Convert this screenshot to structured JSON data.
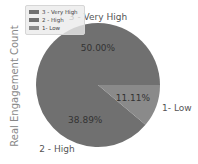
{
  "chart_data": {
    "type": "pie",
    "title": "",
    "ylabel": "Real Engagement Count",
    "categories": [
      "3 - Very High",
      "2 - High",
      "1- Low"
    ],
    "values": [
      50.0,
      38.89,
      11.11
    ],
    "labels_pct": [
      "50.00%",
      "38.89%",
      "11.11%"
    ],
    "colors": [
      "#707070",
      "#707070",
      "#8a8a8a"
    ],
    "startangle": 0,
    "legend_position": "upper left"
  },
  "legend": {
    "items": [
      {
        "label": "3 - Very High",
        "color": "#707070"
      },
      {
        "label": "2 - High",
        "color": "#707070"
      },
      {
        "label": "1- Low",
        "color": "#8a8a8a"
      }
    ]
  }
}
